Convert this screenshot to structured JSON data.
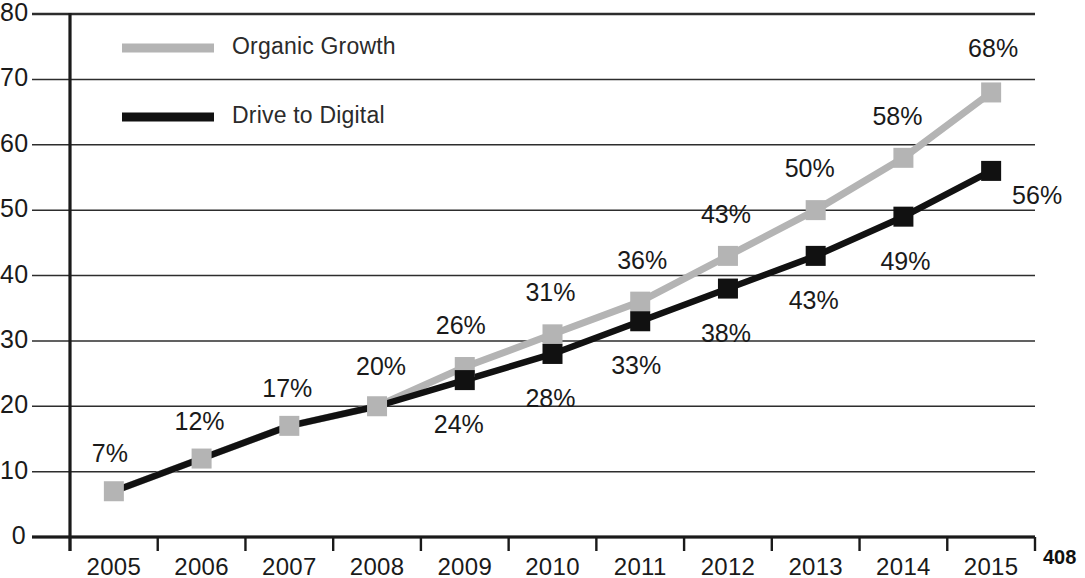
{
  "page_number": "408",
  "chart_data": {
    "type": "line",
    "title": "",
    "xlabel": "",
    "ylabel": "",
    "categories": [
      "2005",
      "2006",
      "2007",
      "2008",
      "2009",
      "2010",
      "2011",
      "2012",
      "2013",
      "2014",
      "2015"
    ],
    "x": [
      2005,
      2006,
      2007,
      2008,
      2009,
      2010,
      2011,
      2012,
      2013,
      2014,
      2015
    ],
    "ylim": [
      0,
      80
    ],
    "y_ticks": [
      0,
      10,
      20,
      30,
      40,
      50,
      60,
      70,
      80
    ],
    "y_tick_labels": [
      "0",
      "10",
      "20",
      "30",
      "40",
      "50",
      "60",
      "70",
      "80"
    ],
    "grid": true,
    "grid_axis": "y",
    "legend_position": "top-left",
    "series": [
      {
        "name": "Organic Growth",
        "color": "#b4b4b4",
        "marker": "square",
        "values": [
          7,
          12,
          17,
          20,
          26,
          31,
          36,
          43,
          50,
          58,
          68
        ],
        "data_labels": [
          "7%",
          "12%",
          "17%",
          "20%",
          "26%",
          "31%",
          "36%",
          "43%",
          "50%",
          "58%",
          "68%"
        ],
        "label_positions": [
          "above",
          "above",
          "above",
          "above",
          "above",
          "above",
          "above",
          "above",
          "above",
          "above",
          "above"
        ]
      },
      {
        "name": "Drive to Digital",
        "color": "#111111",
        "marker": "square",
        "values": [
          7,
          12,
          17,
          20,
          24,
          28,
          33,
          38,
          43,
          49,
          56
        ],
        "data_labels": [
          "",
          "",
          "",
          "",
          "24%",
          "28%",
          "33%",
          "38%",
          "43%",
          "49%",
          "56%"
        ],
        "label_positions": [
          "",
          "",
          "",
          "",
          "below",
          "below",
          "below",
          "below",
          "below",
          "below",
          "right"
        ]
      }
    ],
    "legend": [
      {
        "label": "Organic Growth",
        "color": "#b4b4b4"
      },
      {
        "label": "Drive to Digital",
        "color": "#111111"
      }
    ]
  }
}
